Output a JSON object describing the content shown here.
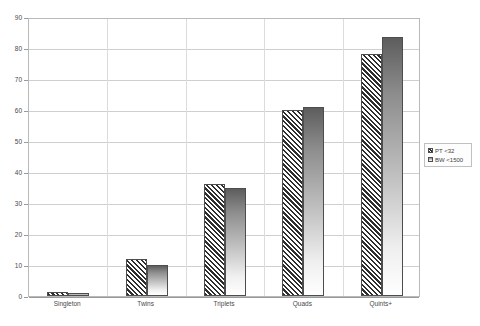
{
  "chart_data": {
    "type": "bar",
    "title": "",
    "xlabel": "",
    "ylabel": "",
    "ylim": [
      0,
      90
    ],
    "grid": true,
    "legend_position": "right",
    "categories": [
      "Singleton",
      "Twins",
      "Triplets",
      "Quads",
      "Quints+"
    ],
    "yticks": [
      0,
      10,
      20,
      30,
      40,
      50,
      60,
      70,
      80,
      90
    ],
    "ytick_labels": [
      "0",
      "10",
      "20",
      "30",
      "40",
      "50",
      "60",
      "70",
      "80",
      "90"
    ],
    "series": [
      {
        "name": "PT <32",
        "pattern": "diagonal-hatch",
        "values": [
          1.2,
          12,
          36,
          60,
          78
        ]
      },
      {
        "name": "BW <1500",
        "pattern": "vertical-gradient",
        "values": [
          1.1,
          10,
          34.8,
          61,
          83.5
        ]
      }
    ]
  },
  "legend": {
    "items": [
      {
        "label": "PT <32"
      },
      {
        "label": "BW <1500"
      }
    ]
  },
  "colors": {
    "hatch": "#2e2e2e",
    "gradient_top": "#5d5d5d",
    "gradient_bottom": "#ffffff",
    "bar_border": "#4d4d4d",
    "gridline": "#cfcfcf",
    "axis": "#9a9a9a",
    "background": "#ffffff"
  }
}
